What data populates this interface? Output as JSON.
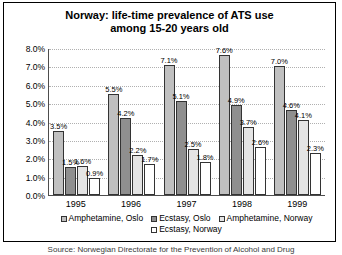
{
  "chart_data": {
    "type": "bar",
    "title": "Norway: life-time prevalence of ATS use among 15-20 years old",
    "title_line1": "Norway: life-time prevalence of ATS use",
    "title_line2": "among 15-20 years old",
    "xlabel": "",
    "ylabel": "",
    "ylim": [
      0,
      8
    ],
    "ytick_labels": [
      "8.0%",
      "7.0%",
      "6.0%",
      "5.0%",
      "4.0%",
      "3.0%",
      "2.0%",
      "1.0%",
      "0.0%"
    ],
    "ytick_values": [
      8,
      7,
      6,
      5,
      4,
      3,
      2,
      1,
      0
    ],
    "grid": true,
    "legend_position": "bottom",
    "categories": [
      "1995",
      "1996",
      "1997",
      "1998",
      "1999"
    ],
    "series": [
      {
        "name": "Amphetamine, Oslo",
        "color": "#c0c0c0",
        "values": [
          3.5,
          5.5,
          7.1,
          7.6,
          7.0
        ],
        "labels": [
          "3.5%",
          "5.5%",
          "7.1%",
          "7.6%",
          "7.0%"
        ]
      },
      {
        "name": "Ecstasy, Oslo",
        "color": "#8f8f8f",
        "values": [
          1.5,
          4.2,
          5.1,
          4.9,
          4.6
        ],
        "labels": [
          "1.5%",
          "4.2%",
          "5.1%",
          "4.9%",
          "4.6%"
        ]
      },
      {
        "name": "Amphetamine, Norway",
        "color": "#e4e4e4",
        "values": [
          1.6,
          2.2,
          2.5,
          3.7,
          4.1
        ],
        "labels": [
          "1.6%",
          "2.2%",
          "2.5%",
          "3.7%",
          "4.1%"
        ]
      },
      {
        "name": "Ecstasy, Norway",
        "color": "#ffffff",
        "values": [
          0.9,
          1.7,
          1.8,
          2.6,
          2.3
        ],
        "labels": [
          "0.9%",
          "1.7%",
          "1.8%",
          "2.6%",
          "2.3%"
        ]
      }
    ]
  },
  "caption": "Source: Norwegian Directorate for the Prevention of Alcohol and Drug"
}
